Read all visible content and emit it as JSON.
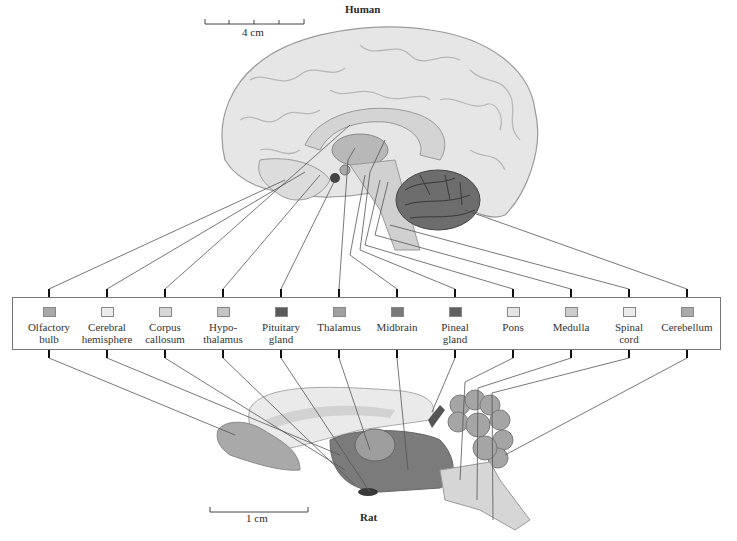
{
  "page_number": "456",
  "human": {
    "title": "Human",
    "scale_label": "4 cm"
  },
  "rat": {
    "title": "Rat",
    "scale_label": "1 cm"
  },
  "legend": {
    "items": [
      {
        "line1": "Olfactory",
        "line2": "bulb",
        "color": "#a8a8a8"
      },
      {
        "line1": "Cerebral",
        "line2": "hemisphere",
        "color": "#ececec"
      },
      {
        "line1": "Corpus",
        "line2": "callosum",
        "color": "#d6d6d6"
      },
      {
        "line1": "Hypo-",
        "line2": "thalamus",
        "color": "#c4c4c4"
      },
      {
        "line1": "Pituitary",
        "line2": "gland",
        "color": "#5a5a5a"
      },
      {
        "line1": "Thalamus",
        "line2": "",
        "color": "#a0a0a0"
      },
      {
        "line1": "Midbrain",
        "line2": "",
        "color": "#7a7a7a"
      },
      {
        "line1": "Pineal",
        "line2": "gland",
        "color": "#606060"
      },
      {
        "line1": "Pons",
        "line2": "",
        "color": "#e4e4e4"
      },
      {
        "line1": "Medulla",
        "line2": "",
        "color": "#cdcdcd"
      },
      {
        "line1": "Spinal",
        "line2": "cord",
        "color": "#ececec"
      },
      {
        "line1": "Cerebellum",
        "line2": "",
        "color": "#aaaaaa"
      }
    ]
  }
}
